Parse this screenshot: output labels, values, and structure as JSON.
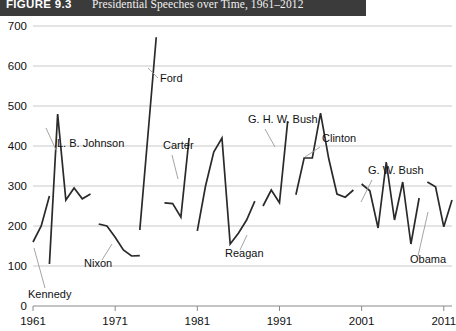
{
  "figure": {
    "number": "FIGURE 9.3",
    "title": "Presidential Speeches over Time, 1961–2012"
  },
  "chart_data": {
    "type": "line",
    "title": "Presidential Speeches over Time, 1961–2012",
    "xlabel": "",
    "ylabel": "",
    "xlim": [
      1961,
      2012
    ],
    "ylim": [
      0,
      700
    ],
    "ytick_values": [
      0,
      100,
      200,
      300,
      400,
      500,
      600,
      700
    ],
    "ytick_labels": [
      "0",
      "100",
      "200",
      "300",
      "400",
      "500",
      "600",
      "700"
    ],
    "xtick_values": [
      1961,
      1971,
      1981,
      1991,
      2001,
      2011
    ],
    "xtick_labels": [
      "1961",
      "1971",
      "1981",
      "1991",
      "2001",
      "2011"
    ],
    "grid": true,
    "legend_position": "inline-annotations",
    "line_color": "#2a2a2a",
    "series": [
      {
        "name": "Kennedy",
        "x": [
          1961,
          1962,
          1963
        ],
        "values": [
          160,
          200,
          275
        ]
      },
      {
        "name": "L. B. Johnson",
        "x": [
          1963,
          1964,
          1965,
          1966,
          1967,
          1968
        ],
        "values": [
          105,
          480,
          265,
          295,
          268,
          280
        ]
      },
      {
        "name": "Nixon",
        "x": [
          1969,
          1970,
          1971,
          1972,
          1973,
          1974
        ],
        "values": [
          205,
          200,
          172,
          140,
          125,
          126
        ]
      },
      {
        "name": "Ford",
        "x": [
          1974,
          1975,
          1976
        ],
        "values": [
          190,
          430,
          672
        ]
      },
      {
        "name": "Carter",
        "x": [
          1977,
          1978,
          1979,
          1980
        ],
        "values": [
          258,
          256,
          222,
          420
        ]
      },
      {
        "name": "Reagan",
        "x": [
          1981,
          1982,
          1983,
          1984,
          1985,
          1986,
          1987,
          1988
        ],
        "values": [
          188,
          300,
          385,
          420,
          155,
          182,
          215,
          262
        ]
      },
      {
        "name": "G. H. W. Bush",
        "x": [
          1989,
          1990,
          1991,
          1992
        ],
        "values": [
          250,
          290,
          258,
          462
        ]
      },
      {
        "name": "Clinton",
        "x": [
          1993,
          1994,
          1995,
          1996,
          1997,
          1998,
          1999,
          2000
        ],
        "values": [
          278,
          370,
          370,
          482,
          368,
          280,
          272,
          290
        ]
      },
      {
        "name": "G. W. Bush",
        "x": [
          2001,
          2002,
          2003,
          2004,
          2005,
          2006,
          2007,
          2008
        ],
        "values": [
          305,
          288,
          195,
          360,
          215,
          310,
          155,
          270
        ]
      },
      {
        "name": "Obama",
        "x": [
          2009,
          2010,
          2011,
          2012
        ],
        "values": [
          310,
          298,
          198,
          265
        ]
      }
    ],
    "annotations": [
      {
        "label": "Kennedy",
        "x": 1961,
        "y": 60
      },
      {
        "label": "L. B. Johnson",
        "x": 1966,
        "y": 440
      },
      {
        "label": "Nixon",
        "x": 1971,
        "y": 140
      },
      {
        "label": "Ford",
        "x": 1977,
        "y": 600
      },
      {
        "label": "Carter",
        "x": 1979,
        "y": 430
      },
      {
        "label": "Reagan",
        "x": 1986,
        "y": 150
      },
      {
        "label": "G. H. W. Bush",
        "x": 1992,
        "y": 500
      },
      {
        "label": "Clinton",
        "x": 1997,
        "y": 450
      },
      {
        "label": "G. W. Bush",
        "x": 2006,
        "y": 370
      },
      {
        "label": "Obama",
        "x": 2010,
        "y": 120
      }
    ]
  }
}
